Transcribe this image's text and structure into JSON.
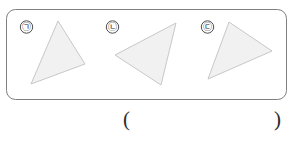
{
  "figure": {
    "name": "three-triangles-figure",
    "panel": {
      "shape": "rounded-rectangle",
      "x": 6,
      "y": 9,
      "width": 281,
      "height": 91,
      "radius": 9,
      "stroke_color": "#7f7f7f",
      "stroke_width": 1,
      "fill_color": "#ffffff"
    },
    "shape_style": {
      "fill_color": "#f1f1f1",
      "stroke_color": "#c8c8c8",
      "stroke_width": 1
    },
    "label_style": {
      "circle_diameter": 13,
      "stroke_color": "#3a3a3a",
      "text_color": "#1a1a1a",
      "font_size": 9
    },
    "items": [
      {
        "label": "㉠",
        "label_name": "label-giyeok",
        "label_cx": 26.5,
        "label_cy": 27,
        "shape_name": "triangle-1",
        "points": "58,21 85,64 31,84"
      },
      {
        "label": "㉡",
        "label_name": "label-nieun",
        "label_cx": 112.5,
        "label_cy": 27,
        "shape_name": "triangle-2",
        "points": "176,23 115,55 161,85"
      },
      {
        "label": "㉢",
        "label_name": "label-digeut",
        "label_cx": 207.5,
        "label_cy": 27,
        "shape_name": "triangle-3",
        "points": "229,22 272,51 208,79"
      }
    ]
  },
  "answer": {
    "open_paren": "(",
    "close_paren": ")",
    "value": ""
  }
}
